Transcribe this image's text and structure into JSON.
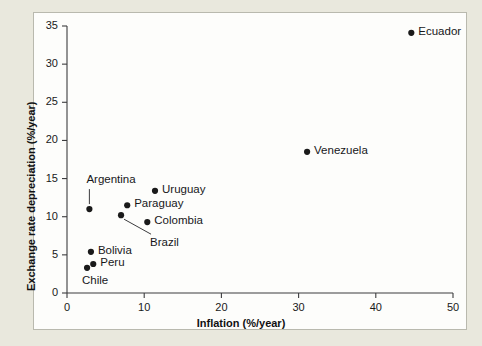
{
  "figure": {
    "panel_background": "#fdfdfb",
    "mat_background": "#e9e8dd",
    "frame_color": "#b9b9ae",
    "marker_color": "#1a1a1a",
    "axis_color": "#3c3c3e"
  },
  "chart_data": {
    "type": "scatter",
    "title": "",
    "xlabel": "Inflation (%/year)",
    "ylabel": "Exchange rate depreciation (%/year)",
    "xlim": [
      0,
      50
    ],
    "ylim": [
      0,
      35
    ],
    "xticks": [
      0,
      10,
      20,
      30,
      40,
      50
    ],
    "yticks": [
      0,
      5,
      10,
      15,
      20,
      25,
      30,
      35
    ],
    "grid": false,
    "legend": "none",
    "points": [
      {
        "label": "Ecuador",
        "x": 44.6,
        "y": 34.1,
        "label_position": "right",
        "leader": false
      },
      {
        "label": "Venezuela",
        "x": 31.1,
        "y": 18.5,
        "label_position": "right",
        "leader": false
      },
      {
        "label": "Uruguay",
        "x": 11.4,
        "y": 13.4,
        "label_position": "right",
        "leader": false
      },
      {
        "label": "Paraguay",
        "x": 7.8,
        "y": 11.5,
        "label_position": "right",
        "leader": false
      },
      {
        "label": "Colombia",
        "x": 10.4,
        "y": 9.3,
        "label_position": "right",
        "leader": false
      },
      {
        "label": "Argentina",
        "x": 2.9,
        "y": 11.0,
        "label_position": "above-leader",
        "leader": true
      },
      {
        "label": "Brazil",
        "x": 7.0,
        "y": 10.2,
        "label_position": "below-leader",
        "leader": true
      },
      {
        "label": "Bolivia",
        "x": 3.1,
        "y": 5.4,
        "label_position": "right",
        "leader": false
      },
      {
        "label": "Peru",
        "x": 3.4,
        "y": 3.8,
        "label_position": "right",
        "leader": false
      },
      {
        "label": "Chile",
        "x": 2.6,
        "y": 3.3,
        "label_position": "below",
        "leader": false
      }
    ]
  }
}
